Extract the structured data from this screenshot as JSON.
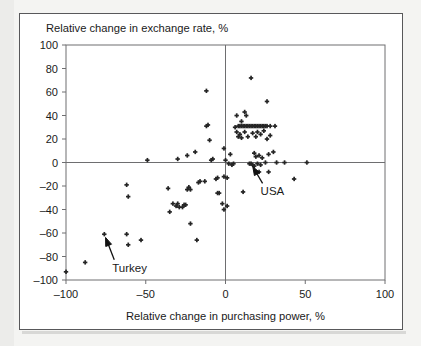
{
  "chart_data": {
    "type": "scatter",
    "title": "",
    "xlabel": "Relative change in purchasing power, %",
    "ylabel": "Relative change in exchange rate, %",
    "xlim": [
      -100,
      100
    ],
    "ylim": [
      -100,
      100
    ],
    "xticks": [
      -100,
      -50,
      0,
      50,
      100
    ],
    "yticks": [
      -100,
      -80,
      -60,
      -40,
      -20,
      0,
      20,
      40,
      60,
      80,
      100
    ],
    "xtick_labels": [
      "-100",
      "-50",
      "0",
      "50",
      "100"
    ],
    "ytick_labels": [
      "-100",
      "-80",
      "-60",
      "-40",
      "-20",
      "0",
      "20",
      "40",
      "60",
      "80",
      "100"
    ],
    "grid": false,
    "legend": false,
    "zero_lines": {
      "x": 0,
      "y": 0
    },
    "marker": {
      "shape": "cross-dot",
      "size": 3,
      "color": "#252525"
    },
    "annotations": [
      {
        "label": "Turkey",
        "label_x": -71,
        "label_y": -93,
        "point_x": -76,
        "point_y": -61,
        "arrow": "up-left"
      },
      {
        "label": "USA",
        "label_x": 22,
        "label_y": -28,
        "point_x": 16,
        "point_y": -1,
        "arrow": "up-left"
      }
    ],
    "points": [
      {
        "x": -100,
        "y": -93
      },
      {
        "x": -88,
        "y": -85
      },
      {
        "x": -76,
        "y": -61
      },
      {
        "x": -62,
        "y": -61
      },
      {
        "x": -61,
        "y": -70
      },
      {
        "x": -53,
        "y": -66
      },
      {
        "x": -62,
        "y": -19
      },
      {
        "x": -61,
        "y": -29
      },
      {
        "x": -49,
        "y": 2
      },
      {
        "x": -36,
        "y": -22
      },
      {
        "x": -35,
        "y": -42
      },
      {
        "x": -33,
        "y": -35
      },
      {
        "x": -31,
        "y": -37
      },
      {
        "x": -30,
        "y": -35
      },
      {
        "x": -29,
        "y": -38
      },
      {
        "x": -27,
        "y": -38
      },
      {
        "x": -26,
        "y": -36
      },
      {
        "x": -25,
        "y": -36
      },
      {
        "x": -24,
        "y": -23
      },
      {
        "x": -23,
        "y": -21
      },
      {
        "x": -22,
        "y": -23
      },
      {
        "x": -22,
        "y": -52
      },
      {
        "x": -30,
        "y": 3
      },
      {
        "x": -24,
        "y": 6
      },
      {
        "x": -19,
        "y": 9
      },
      {
        "x": -18,
        "y": -66
      },
      {
        "x": -17,
        "y": -17
      },
      {
        "x": -16,
        "y": -16
      },
      {
        "x": -13,
        "y": -16
      },
      {
        "x": -12,
        "y": 61
      },
      {
        "x": -12,
        "y": 31
      },
      {
        "x": -11,
        "y": 32
      },
      {
        "x": -10,
        "y": 19
      },
      {
        "x": -9,
        "y": 2
      },
      {
        "x": -8,
        "y": 3
      },
      {
        "x": -6,
        "y": -14
      },
      {
        "x": -5,
        "y": -13
      },
      {
        "x": -5,
        "y": -26
      },
      {
        "x": -4,
        "y": -26
      },
      {
        "x": -2,
        "y": -35
      },
      {
        "x": -1,
        "y": -40
      },
      {
        "x": -1,
        "y": -12
      },
      {
        "x": -1,
        "y": 12
      },
      {
        "x": 0,
        "y": 2
      },
      {
        "x": 1,
        "y": -37
      },
      {
        "x": 1,
        "y": -13
      },
      {
        "x": 2,
        "y": -1
      },
      {
        "x": 3,
        "y": 7
      },
      {
        "x": 4,
        "y": -2
      },
      {
        "x": 5,
        "y": -1
      },
      {
        "x": 6,
        "y": 30
      },
      {
        "x": 7,
        "y": 26
      },
      {
        "x": 7,
        "y": 40
      },
      {
        "x": 8,
        "y": 31
      },
      {
        "x": 8,
        "y": 22
      },
      {
        "x": 9,
        "y": 31
      },
      {
        "x": 9,
        "y": 24
      },
      {
        "x": 10,
        "y": 31
      },
      {
        "x": 10,
        "y": 35
      },
      {
        "x": 10,
        "y": 21
      },
      {
        "x": 11,
        "y": 31
      },
      {
        "x": 11,
        "y": -25
      },
      {
        "x": 12,
        "y": 31
      },
      {
        "x": 12,
        "y": 26
      },
      {
        "x": 12,
        "y": 43
      },
      {
        "x": 13,
        "y": 31
      },
      {
        "x": 13,
        "y": 40
      },
      {
        "x": 14,
        "y": 31
      },
      {
        "x": 14,
        "y": 22
      },
      {
        "x": 15,
        "y": 31
      },
      {
        "x": 15,
        "y": -1
      },
      {
        "x": 16,
        "y": 31
      },
      {
        "x": 16,
        "y": -1
      },
      {
        "x": 16,
        "y": 72
      },
      {
        "x": 17,
        "y": 31
      },
      {
        "x": 17,
        "y": 25
      },
      {
        "x": 17,
        "y": -2
      },
      {
        "x": 18,
        "y": 31
      },
      {
        "x": 18,
        "y": 8
      },
      {
        "x": 18,
        "y": -3
      },
      {
        "x": 19,
        "y": 31
      },
      {
        "x": 19,
        "y": 22
      },
      {
        "x": 19,
        "y": 5
      },
      {
        "x": 20,
        "y": 31
      },
      {
        "x": 20,
        "y": 26
      },
      {
        "x": 20,
        "y": -1
      },
      {
        "x": 21,
        "y": 31
      },
      {
        "x": 21,
        "y": 6
      },
      {
        "x": 21,
        "y": -8
      },
      {
        "x": 22,
        "y": 31
      },
      {
        "x": 22,
        "y": 24
      },
      {
        "x": 22,
        "y": -2
      },
      {
        "x": 23,
        "y": 31
      },
      {
        "x": 23,
        "y": 4
      },
      {
        "x": 24,
        "y": 31
      },
      {
        "x": 24,
        "y": 27
      },
      {
        "x": 25,
        "y": 31
      },
      {
        "x": 25,
        "y": 0
      },
      {
        "x": 26,
        "y": 31
      },
      {
        "x": 26,
        "y": 20
      },
      {
        "x": 26,
        "y": 52
      },
      {
        "x": 27,
        "y": 7
      },
      {
        "x": 27,
        "y": -8
      },
      {
        "x": 28,
        "y": 31
      },
      {
        "x": 28,
        "y": 23
      },
      {
        "x": 30,
        "y": 9
      },
      {
        "x": 31,
        "y": 31
      },
      {
        "x": 32,
        "y": 0
      },
      {
        "x": 37,
        "y": 0
      },
      {
        "x": 43,
        "y": -14
      },
      {
        "x": 51,
        "y": 0
      }
    ]
  }
}
